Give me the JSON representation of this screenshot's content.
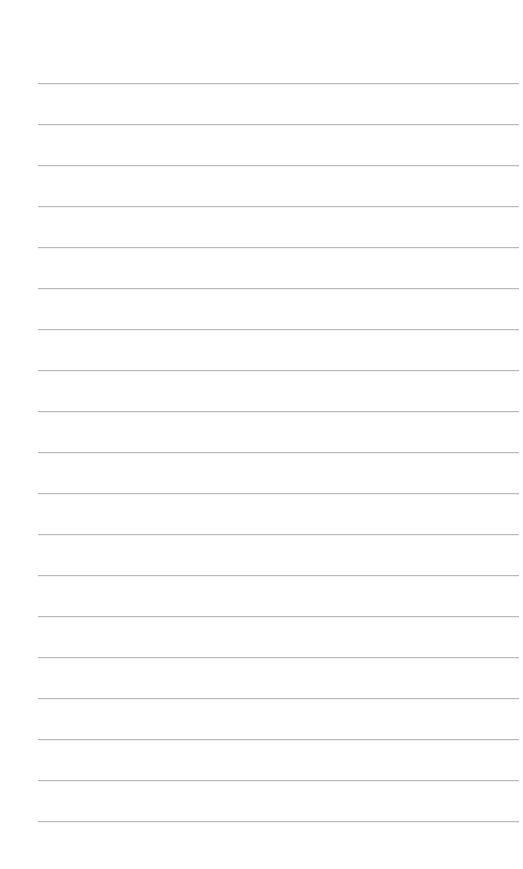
{
  "page": {
    "background_color": "#ffffff",
    "line_color": "#b9b9b9",
    "line_left": 38,
    "line_width": 481,
    "first_line_y": 83,
    "line_spacing": 41,
    "line_count": 19
  }
}
